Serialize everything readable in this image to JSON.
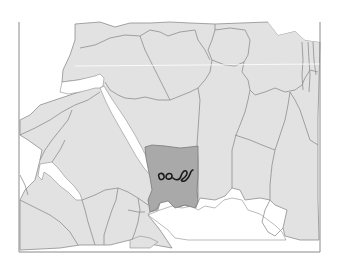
{
  "map": {
    "style": "grayscale political boundary map",
    "colors": {
      "background": "#ffffff",
      "land": "#e2e2e2",
      "border": "#8e8e8e",
      "highlight": "#a9a9a9",
      "water": "#ffffff",
      "frame": "#8a8a8a",
      "scribble": "#1a1a1a"
    },
    "highlighted_region": {
      "label": "",
      "marker": "handwritten-scribble"
    },
    "frame": {
      "x": 18,
      "y": 22,
      "width": 131,
      "height": 97
    }
  }
}
